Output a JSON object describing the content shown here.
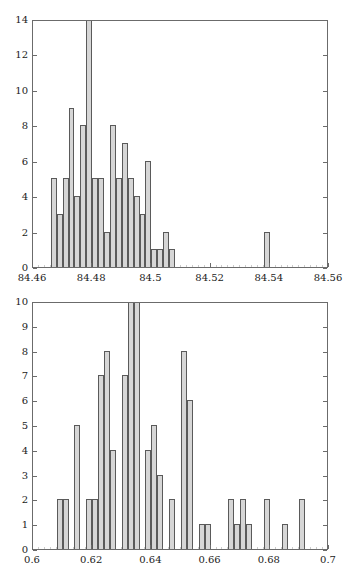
{
  "figure": {
    "background": "#ffffff",
    "bar_fill": "#d6d6d6",
    "bar_edge": "#5a5a5a",
    "axis_color": "#6b6b6b",
    "text_color": "#1a1a1a"
  },
  "chart_data": [
    {
      "type": "bar",
      "title": "",
      "subtitle": "",
      "xlabel": "",
      "ylabel": "",
      "grid": false,
      "legend": null,
      "xlim": [
        84.46,
        84.56
      ],
      "ylim": [
        0,
        14
      ],
      "xticks": [
        "84.46",
        "84.48",
        "84.5",
        "84.52",
        "84.54",
        "84.56"
      ],
      "xtick_values": [
        84.46,
        84.48,
        84.5,
        84.52,
        84.54,
        84.56
      ],
      "yticks": [
        "0",
        "2",
        "4",
        "6",
        "8",
        "10",
        "12",
        "14"
      ],
      "ytick_values": [
        0,
        2,
        4,
        6,
        8,
        10,
        12,
        14
      ],
      "bin_width": 0.002,
      "bin_starts": [
        84.466,
        84.468,
        84.47,
        84.472,
        84.474,
        84.476,
        84.478,
        84.48,
        84.482,
        84.484,
        84.486,
        84.488,
        84.49,
        84.492,
        84.494,
        84.496,
        84.498,
        84.5,
        84.502,
        84.504,
        84.506,
        84.508,
        84.51,
        84.512,
        84.514,
        84.538
      ],
      "values": [
        5,
        3,
        5,
        9,
        4,
        8,
        14,
        5,
        5,
        2,
        8,
        5,
        7,
        5,
        4,
        3,
        6,
        1,
        1,
        2,
        1,
        0,
        0,
        0,
        0,
        2
      ],
      "clipped_bars": [
        6
      ],
      "clipped_note": "bar at 84.478 extends beyond y-axis maximum of 14",
      "notes": "histogram of 100 measurements"
    },
    {
      "type": "bar",
      "title": "",
      "subtitle": "",
      "xlabel": "",
      "ylabel": "",
      "grid": false,
      "legend": null,
      "xlim": [
        0.6,
        0.7
      ],
      "ylim": [
        0,
        10
      ],
      "xticks": [
        "0.6",
        "0.62",
        "0.64",
        "0.66",
        "0.68",
        "0.7"
      ],
      "xtick_values": [
        0.6,
        0.62,
        0.64,
        0.66,
        0.68,
        0.7
      ],
      "yticks": [
        "0",
        "1",
        "2",
        "3",
        "4",
        "5",
        "6",
        "7",
        "8",
        "9",
        "10"
      ],
      "ytick_values": [
        0,
        1,
        2,
        3,
        4,
        5,
        6,
        7,
        8,
        9,
        10
      ],
      "bin_width": 0.002,
      "bin_starts": [
        0.608,
        0.61,
        0.612,
        0.614,
        0.616,
        0.618,
        0.62,
        0.622,
        0.624,
        0.626,
        0.628,
        0.63,
        0.632,
        0.634,
        0.636,
        0.638,
        0.64,
        0.642,
        0.644,
        0.646,
        0.648,
        0.65,
        0.652,
        0.654,
        0.656,
        0.658,
        0.66,
        0.662,
        0.664,
        0.666,
        0.668,
        0.67,
        0.672,
        0.674,
        0.676,
        0.678,
        0.68,
        0.682,
        0.684,
        0.686,
        0.688,
        0.69,
        0.692,
        0.694
      ],
      "values": [
        2,
        2,
        0,
        5,
        0,
        2,
        2,
        7,
        8,
        4,
        0,
        7,
        10,
        10,
        0,
        4,
        5,
        3,
        0,
        2,
        0,
        8,
        6,
        0,
        1,
        1,
        0,
        0,
        0,
        2,
        1,
        2,
        1,
        0,
        0,
        2,
        0,
        0,
        1,
        0,
        0,
        2,
        0,
        0
      ],
      "clipped_bars": [
        12,
        13
      ],
      "clipped_note": "bars at 0.636 and 0.638 extend beyond y-axis maximum of 10",
      "notes": "histogram of 100 measurements"
    }
  ]
}
